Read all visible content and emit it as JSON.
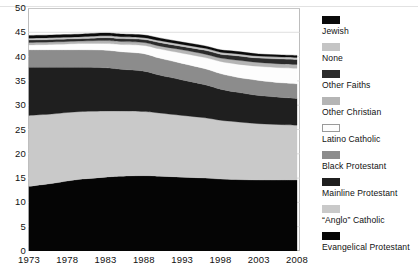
{
  "chart_data": {
    "type": "area",
    "title": "",
    "subtitle": "",
    "xlabel": "",
    "ylabel": "",
    "stacked": true,
    "grid": true,
    "legend_position": "right",
    "xlim": [
      1973,
      2008
    ],
    "ylim": [
      0,
      50
    ],
    "ytick_labels": [
      "0",
      "5",
      "10",
      "15",
      "20",
      "25",
      "30",
      "35",
      "40",
      "45",
      "50"
    ],
    "ytick_values": [
      0,
      5,
      10,
      15,
      20,
      25,
      30,
      35,
      40,
      45,
      50
    ],
    "xtick_labels": [
      "1973",
      "1978",
      "1983",
      "1988",
      "1993",
      "1998",
      "2003",
      "2008"
    ],
    "xtick_values": [
      1973,
      1978,
      1983,
      1988,
      1993,
      1998,
      2003,
      2008
    ],
    "x": [
      1973,
      1976,
      1978,
      1980,
      1983,
      1985,
      1988,
      1990,
      1993,
      1996,
      1998,
      2000,
      2003,
      2006,
      2008
    ],
    "series": [
      {
        "name": "Evangelical Protestant",
        "color": "#050505",
        "values": [
          13.3,
          13.9,
          14.4,
          14.8,
          15.2,
          15.4,
          15.5,
          15.4,
          15.2,
          15.0,
          14.8,
          14.7,
          14.6,
          14.6,
          14.6
        ]
      },
      {
        "name": "“Anglo” Catholic",
        "color": "#c9c9c9",
        "values": [
          14.6,
          14.3,
          14.1,
          13.9,
          13.6,
          13.4,
          13.2,
          13.0,
          12.7,
          12.4,
          12.1,
          11.9,
          11.6,
          11.4,
          11.3
        ]
      },
      {
        "name": "Mainline Protestant",
        "color": "#1f1f1f",
        "values": [
          9.9,
          9.6,
          9.3,
          9.1,
          8.9,
          8.6,
          8.3,
          7.8,
          7.3,
          6.8,
          6.4,
          6.1,
          5.8,
          5.6,
          5.5
        ]
      },
      {
        "name": "Black Protestant",
        "color": "#8c8c8c",
        "values": [
          3.6,
          3.6,
          3.6,
          3.6,
          3.6,
          3.6,
          3.6,
          3.5,
          3.4,
          3.3,
          3.2,
          3.1,
          3.1,
          3.0,
          3.0
        ]
      },
      {
        "name": "Latino Catholic",
        "color": "#fdfdfd",
        "values": [
          1.0,
          1.1,
          1.2,
          1.3,
          1.4,
          1.5,
          1.7,
          1.9,
          2.1,
          2.3,
          2.5,
          2.7,
          2.9,
          3.1,
          3.2
        ]
      },
      {
        "name": "Other Christian",
        "color": "#b5b5b5",
        "values": [
          0.5,
          0.5,
          0.5,
          0.5,
          0.6,
          0.6,
          0.6,
          0.6,
          0.7,
          0.7,
          0.7,
          0.8,
          0.8,
          0.8,
          0.8
        ]
      },
      {
        "name": "Other Faiths",
        "color": "#2b2b2b",
        "values": [
          0.5,
          0.5,
          0.5,
          0.5,
          0.6,
          0.6,
          0.6,
          0.7,
          0.7,
          0.8,
          0.8,
          0.9,
          0.9,
          1.0,
          1.0
        ]
      },
      {
        "name": "None",
        "color": "#c4c4c4",
        "values": [
          0.4,
          0.4,
          0.4,
          0.4,
          0.4,
          0.4,
          0.4,
          0.4,
          0.4,
          0.4,
          0.4,
          0.4,
          0.4,
          0.4,
          0.4
        ]
      },
      {
        "name": "Jewish",
        "color": "#0a0a0a",
        "values": [
          0.55,
          0.55,
          0.55,
          0.55,
          0.55,
          0.55,
          0.55,
          0.55,
          0.5,
          0.5,
          0.5,
          0.5,
          0.45,
          0.45,
          0.45
        ]
      }
    ]
  },
  "legend": {
    "items": [
      {
        "label": "Jewish",
        "color": "#0a0a0a",
        "bordered": false
      },
      {
        "label": "None",
        "color": "#c4c4c4",
        "bordered": false
      },
      {
        "label": "Other Faiths",
        "color": "#2b2b2b",
        "bordered": false
      },
      {
        "label": "Other Christian",
        "color": "#b5b5b5",
        "bordered": false
      },
      {
        "label": "Latino Catholic",
        "color": "#fdfdfd",
        "bordered": true
      },
      {
        "label": "Black Protestant",
        "color": "#8c8c8c",
        "bordered": false
      },
      {
        "label": "Mainline Protestant",
        "color": "#1f1f1f",
        "bordered": false
      },
      {
        "label": "“Anglo” Catholic",
        "color": "#c9c9c9",
        "bordered": false
      },
      {
        "label": "Evangelical Protestant",
        "color": "#050505",
        "bordered": false
      }
    ]
  },
  "style": {
    "grid_color": "#d8d8d8",
    "frame_color": "#bdbdbd",
    "background": "#ffffff",
    "text_color": "#111111"
  }
}
